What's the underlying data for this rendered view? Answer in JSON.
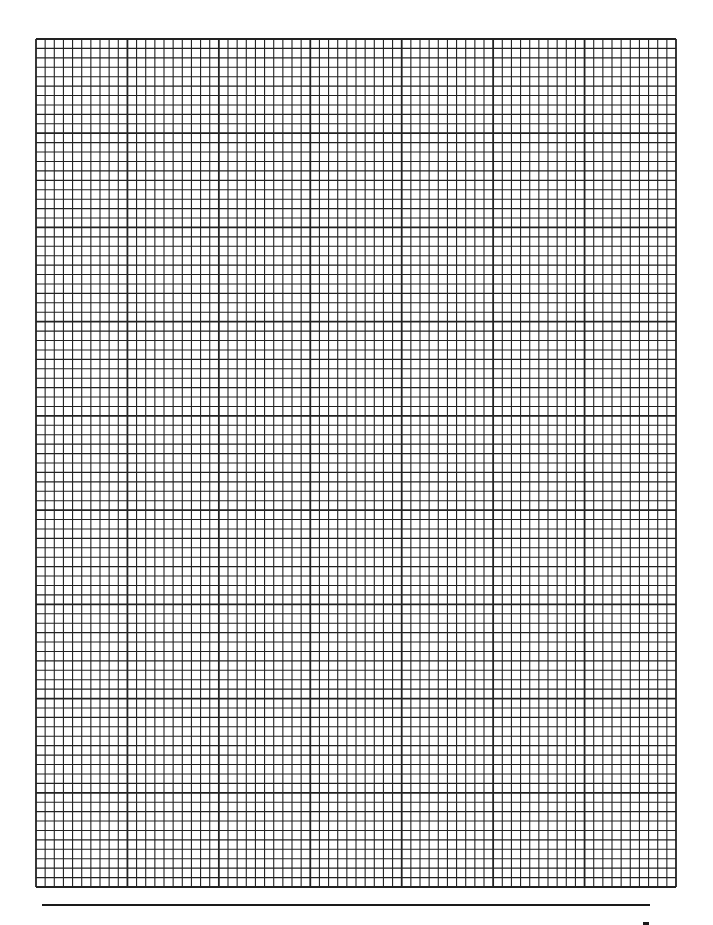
{
  "sheet": {
    "type": "graph-paper",
    "columns": 70,
    "rows": 90,
    "cells_per_major": 10,
    "grid": {
      "left": 36,
      "top": 39,
      "right": 676,
      "bottom": 887
    },
    "colors": {
      "line": "#222222",
      "background": "#ffffff"
    }
  },
  "footer": {
    "rule": {
      "x1": 42,
      "y": 905,
      "x2": 650
    },
    "mark": {
      "x": 643,
      "y": 922,
      "w": 6,
      "h": 3
    }
  }
}
